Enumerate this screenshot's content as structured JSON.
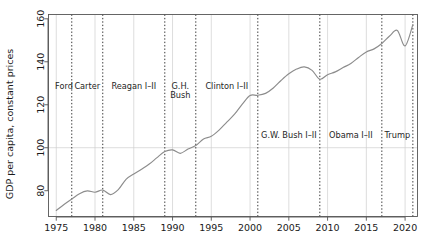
{
  "chart_data": {
    "type": "line",
    "title": "",
    "subtitle": "",
    "xlabel": "",
    "ylabel": "GDP per capita, constant prices",
    "xlim": [
      1974.0,
      1974.0
    ],
    "ylim": [
      68,
      162
    ],
    "grid": true,
    "legend_position": "none",
    "y_ticks": [
      "80",
      "100",
      "120",
      "140",
      "160"
    ],
    "y_tick_values": [
      80,
      100,
      120,
      140,
      160
    ],
    "x_ticks": [
      "1975",
      "1980",
      "1985",
      "1990",
      "1995",
      "2000",
      "2005",
      "2010",
      "2015",
      "2020"
    ],
    "x_tick_values": [
      1975,
      1980,
      1985,
      1990,
      1995,
      2000,
      2005,
      2010,
      2015,
      2020
    ],
    "reference_line_y": 100,
    "line_color": "#8c8c8c",
    "series": [
      {
        "name": "GDP per capita, constant prices",
        "x": [
          1975,
          1976,
          1977,
          1978,
          1979,
          1980,
          1981,
          1982,
          1983,
          1984,
          1985,
          1986,
          1987,
          1988,
          1989,
          1990,
          1991,
          1992,
          1993,
          1994,
          1995,
          1996,
          1997,
          1998,
          1999,
          2000,
          2001,
          2002,
          2003,
          2004,
          2005,
          2006,
          2007,
          2008,
          2009,
          2010,
          2011,
          2012,
          2013,
          2014,
          2015,
          2016,
          2017,
          2018,
          2019,
          2020,
          2021
        ],
        "values": [
          70.8,
          73.6,
          76.1,
          78.6,
          79.9,
          79.3,
          80.3,
          78.2,
          80.5,
          85.3,
          87.8,
          90.0,
          92.4,
          95.4,
          98.2,
          99.0,
          97.4,
          99.4,
          101.0,
          104.1,
          105.3,
          108.2,
          111.9,
          115.6,
          120.3,
          124.3,
          124.4,
          125.3,
          127.8,
          131.3,
          134.4,
          136.6,
          137.6,
          136.0,
          131.9,
          134.0,
          135.3,
          137.3,
          139.2,
          142.0,
          144.6,
          146.0,
          148.5,
          152.0,
          154.6,
          147.4,
          157.3
        ]
      }
    ],
    "vertical_dividers": [
      {
        "year": 1977,
        "label": "Ford",
        "label_side": "left"
      },
      {
        "year": 1981,
        "label": "Carter"
      },
      {
        "year": 1989,
        "label": "Reagan I-II"
      },
      {
        "year": 1993,
        "label": "G.H. Bush"
      },
      {
        "year": 2001,
        "label": "Clinton I-II"
      },
      {
        "year": 2009,
        "label": "G.W. Bush I-II"
      },
      {
        "year": 2017,
        "label": "Obama I-II"
      },
      {
        "year": 2021,
        "label": "Trump"
      }
    ],
    "term_annotations": [
      {
        "label": "Ford",
        "x_center": 1976.0,
        "y": 127.5,
        "lines": [
          "Ford"
        ]
      },
      {
        "label": "Carter",
        "x_center": 1979.0,
        "y": 127.5,
        "lines": [
          "Carter"
        ]
      },
      {
        "label": "Reagan I-II",
        "x_center": 1985.0,
        "y": 127.5,
        "lines": [
          "Reagan I–II"
        ]
      },
      {
        "label": "G.H. Bush",
        "x_center": 1991.0,
        "y": 127.5,
        "lines": [
          "G.H.",
          "Bush"
        ]
      },
      {
        "label": "Clinton I-II",
        "x_center": 1997.0,
        "y": 127.5,
        "lines": [
          "Clinton I–II"
        ]
      },
      {
        "label": "G.W. Bush I-II",
        "x_center": 2005.0,
        "y": 104.5,
        "lines": [
          "G.W. Bush I–II"
        ]
      },
      {
        "label": "Obama I-II",
        "x_center": 2013.0,
        "y": 104.5,
        "lines": [
          "Obama I–II"
        ]
      },
      {
        "label": "Trump",
        "x_center": 2019.0,
        "y": 104.5,
        "lines": [
          "Trump"
        ]
      }
    ]
  },
  "axis": {
    "y_title": "GDP per capita, constant prices"
  }
}
